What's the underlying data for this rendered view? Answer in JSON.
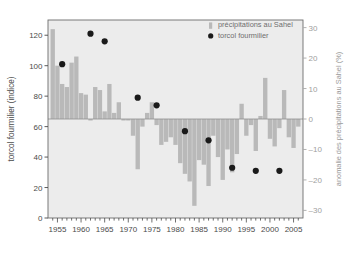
{
  "chart_data": {
    "type": "bar",
    "title": "",
    "subtitle": "",
    "xlabel": "",
    "ylabel": "torcol fourmilier (indice)",
    "ylabel_right": "anomalie des précipitations au Sahel (%)",
    "xlim": [
      1953.0,
      2007.0
    ],
    "ylim": [
      0,
      130
    ],
    "ylim_right": [
      -32.5,
      32.5
    ],
    "yticks": [
      0,
      20,
      40,
      60,
      80,
      100,
      120
    ],
    "yticks_right": [
      30,
      20,
      10,
      0,
      -10,
      -20,
      -30
    ],
    "xticks": [
      1955,
      1960,
      1965,
      1970,
      1975,
      1980,
      1985,
      1990,
      1995,
      2000,
      2005
    ],
    "xtick_labels": [
      "1955",
      "1960",
      "1965",
      "1970",
      "1975",
      "1980",
      "1985",
      "1990",
      "1995",
      "2000",
      "2005"
    ],
    "minor_xticks_step": 1,
    "grid": false,
    "legend_position": "top-right",
    "legend": [
      {
        "label": "précipitations au Sahel",
        "marker": "bar",
        "color": "#b9b9b9"
      },
      {
        "label": "torcol fourmilier",
        "marker": "circle",
        "color": "#1a1a1a"
      }
    ],
    "series": [
      {
        "name": "précipitations au Sahel",
        "type": "bar",
        "axis": "right",
        "unit": "%",
        "color": "#b9b9b9",
        "x": [
          1954,
          1955,
          1956,
          1957,
          1958,
          1959,
          1960,
          1961,
          1962,
          1963,
          1964,
          1965,
          1966,
          1967,
          1968,
          1969,
          1970,
          1971,
          1972,
          1973,
          1974,
          1975,
          1976,
          1977,
          1978,
          1979,
          1980,
          1981,
          1982,
          1983,
          1984,
          1985,
          1986,
          1987,
          1988,
          1989,
          1990,
          1991,
          1992,
          1993,
          1994,
          1995,
          1996,
          1997,
          1998,
          1999,
          2000,
          2001,
          2002,
          2003,
          2004,
          2005,
          2006
        ],
        "values": [
          29.5,
          17.5,
          11.5,
          10.5,
          18.5,
          20.5,
          8.5,
          8.0,
          -0.5,
          10.5,
          9.5,
          2.5,
          11.5,
          2.0,
          5.5,
          -0.5,
          -0.5,
          -5.5,
          -16.5,
          -2.5,
          2.0,
          5.5,
          -2.0,
          -8.5,
          -7.5,
          -6.0,
          -8.5,
          -14.5,
          -18.0,
          -20.5,
          -28.5,
          -13.5,
          -15.0,
          -22.0,
          -5.5,
          -12.5,
          -20.0,
          -10.0,
          -17.5,
          -11.5,
          5.0,
          -5.5,
          -2.0,
          -10.5,
          1.0,
          13.5,
          -6.5,
          -9.0,
          -3.0,
          9.5,
          -6.0,
          -9.5,
          -2.5
        ]
      },
      {
        "name": "torcol fourmilier",
        "type": "scatter",
        "axis": "left",
        "unit": "indice",
        "color": "#1a1a1a",
        "points": [
          {
            "x": 1956,
            "y": 101
          },
          {
            "x": 1962,
            "y": 121
          },
          {
            "x": 1965,
            "y": 116
          },
          {
            "x": 1972,
            "y": 79
          },
          {
            "x": 1976,
            "y": 74
          },
          {
            "x": 1982,
            "y": 57
          },
          {
            "x": 1987,
            "y": 51
          },
          {
            "x": 1992,
            "y": 33
          },
          {
            "x": 1997,
            "y": 31
          },
          {
            "x": 2002,
            "y": 31
          }
        ]
      }
    ]
  },
  "style": {
    "plot_background": "#ececec",
    "bar_color": "#b9b9b9",
    "dot_color": "#1a1a1a",
    "axis_color": "#4a4a4a",
    "right_axis_color": "#a8a8a8",
    "page_background": "#ffffff"
  }
}
